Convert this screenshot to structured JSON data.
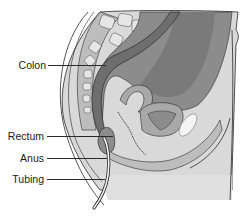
{
  "diagram": {
    "labels": [
      {
        "id": "colon",
        "text": "Colon"
      },
      {
        "id": "rectum",
        "text": "Rectum"
      },
      {
        "id": "anus",
        "text": "Anus"
      },
      {
        "id": "tubing",
        "text": "Tubing"
      }
    ],
    "colors": {
      "outline": "#2a2a2a",
      "skin": "#d9d9d9",
      "bone_light": "#e6e6e6",
      "bone_dark": "#bdbdbd",
      "colon_dark": "#6e6e6e",
      "organ_mid": "#8c8c8c",
      "organ_light": "#a8a8a8",
      "bladder_highlight": "#f4f4f4"
    }
  }
}
